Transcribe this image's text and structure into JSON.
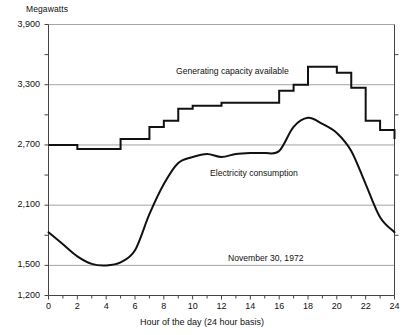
{
  "figure": {
    "yaxis_unit_label": "Megawatts",
    "xaxis_title": "Hour of the day (24 hour basis)",
    "date_annotation": "November 30, 1972",
    "capacity_annotation": "Generating capacity available",
    "consumption_annotation": "Electricity consumption",
    "line_color": "#111111",
    "grid_color": "#9a9a9a",
    "axis_color": "#444444",
    "background": "#ffffff"
  },
  "chart_data": {
    "type": "line",
    "title": "",
    "subtitle": "November 30, 1972",
    "xlabel": "Hour of the day (24 hour basis)",
    "ylabel": "Megawatts",
    "xlim": [
      0,
      24
    ],
    "ylim": [
      1200,
      3900
    ],
    "grid": true,
    "legend_position": "inline-annotation",
    "y_major_ticks": [
      1200,
      1500,
      2100,
      2700,
      3300,
      3900
    ],
    "y_major_tick_labels": [
      "1,200",
      "1,500",
      "2,100",
      "2,700",
      "3,300",
      "3,900"
    ],
    "y_minor_ticks": [
      1800,
      2400,
      3000,
      3600
    ],
    "x_major_ticks": [
      0,
      2,
      4,
      6,
      8,
      10,
      12,
      14,
      16,
      18,
      20,
      22,
      24
    ],
    "x_major_tick_labels": [
      "0",
      "2",
      "4",
      "6",
      "8",
      "10",
      "12",
      "14",
      "16",
      "18",
      "20",
      "22",
      "24"
    ],
    "x_minor_ticks": [
      1,
      3,
      5,
      7,
      9,
      11,
      13,
      15,
      17,
      19,
      21,
      23
    ],
    "series": [
      {
        "name": "Generating capacity available",
        "style": "step",
        "x": [
          0,
          1,
          2,
          3,
          4,
          5,
          6,
          7,
          8,
          9,
          10,
          11,
          12,
          13,
          14,
          15,
          16,
          17,
          18,
          19,
          20,
          21,
          22,
          23,
          24
        ],
        "values": [
          2700,
          2700,
          2660,
          2660,
          2660,
          2760,
          2760,
          2880,
          2940,
          3060,
          3090,
          3090,
          3120,
          3120,
          3120,
          3120,
          3240,
          3300,
          3480,
          3480,
          3420,
          3270,
          2940,
          2850,
          2760
        ]
      },
      {
        "name": "Electricity consumption",
        "style": "smooth-line",
        "x": [
          0,
          1,
          2,
          3,
          4,
          5,
          6,
          7,
          8,
          9,
          10,
          11,
          12,
          13,
          14,
          15,
          16,
          17,
          18,
          19,
          20,
          21,
          22,
          23,
          24
        ],
        "values": [
          1830,
          1710,
          1590,
          1515,
          1500,
          1530,
          1650,
          2010,
          2310,
          2520,
          2580,
          2610,
          2580,
          2610,
          2620,
          2620,
          2640,
          2880,
          2970,
          2910,
          2820,
          2640,
          2310,
          1980,
          1830
        ]
      }
    ]
  }
}
